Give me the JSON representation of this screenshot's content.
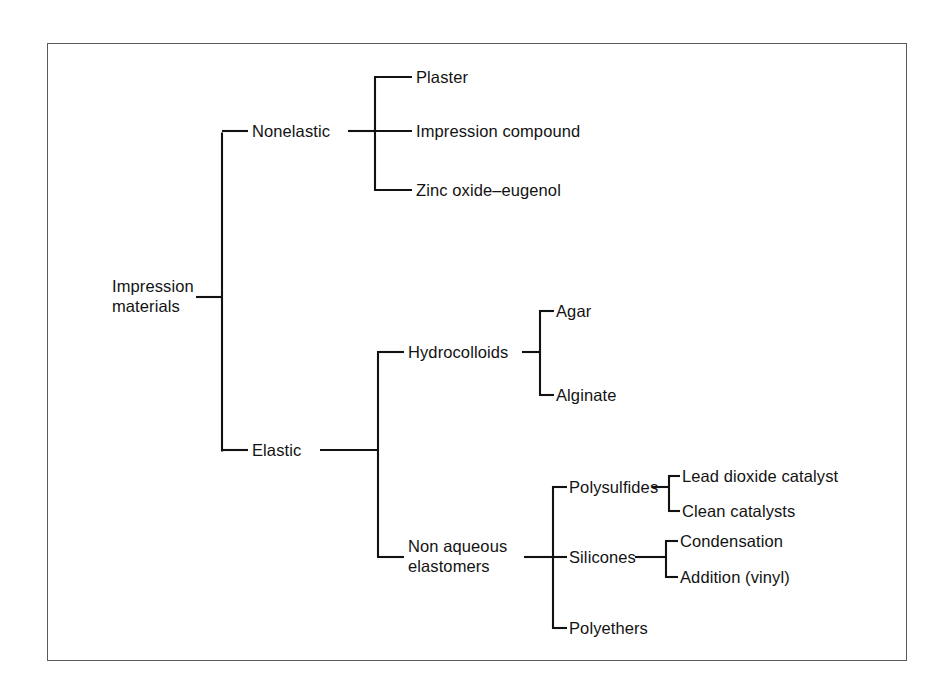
{
  "figure": {
    "kind": "classification-tree",
    "frame": {
      "border_color": "#5a5a5a",
      "background": "#ffffff"
    },
    "line_color": "#121212",
    "text_color": "#131313"
  },
  "tree": {
    "root": {
      "id": "impression-materials",
      "label_line1": "Impression",
      "label_line2": "materials"
    },
    "level1": [
      {
        "id": "nonelastic",
        "label": "Nonelastic"
      },
      {
        "id": "elastic",
        "label": "Elastic"
      }
    ],
    "nonelastic_children": [
      {
        "id": "plaster",
        "label": "Plaster"
      },
      {
        "id": "impression-compound",
        "label": "Impression compound"
      },
      {
        "id": "zinc-oxide-eugenol",
        "label": "Zinc oxide–eugenol"
      }
    ],
    "elastic_children": [
      {
        "id": "hydrocolloids",
        "label": "Hydrocolloids"
      },
      {
        "id": "non-aqueous-elastomers",
        "label_line1": "Non aqueous",
        "label_line2": "elastomers"
      }
    ],
    "hydrocolloid_children": [
      {
        "id": "agar",
        "label": "Agar"
      },
      {
        "id": "alginate",
        "label": "Alginate"
      }
    ],
    "elastomer_children": [
      {
        "id": "polysulfides",
        "label": "Polysulfides"
      },
      {
        "id": "silicones",
        "label": "Silicones"
      },
      {
        "id": "polyethers",
        "label": "Polyethers"
      }
    ],
    "polysulfide_children": [
      {
        "id": "lead-dioxide-catalyst",
        "label": "Lead dioxide catalyst"
      },
      {
        "id": "clean-catalysts",
        "label": "Clean catalysts"
      }
    ],
    "silicone_children": [
      {
        "id": "condensation",
        "label": "Condensation"
      },
      {
        "id": "addition-vinyl",
        "label": "Addition (vinyl)"
      }
    ]
  }
}
